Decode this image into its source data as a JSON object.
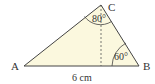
{
  "diagram": {
    "type": "triangle",
    "fill_color": "#fbf8de",
    "stroke_color": "#444444",
    "vertices": {
      "A": {
        "label": "A",
        "x": 24,
        "y": 66
      },
      "B": {
        "label": "B",
        "x": 139,
        "y": 66
      },
      "C": {
        "label": "C",
        "x": 101,
        "y": 5
      }
    },
    "angles": {
      "C": "80°",
      "B": "60°"
    },
    "side_AB_label": "6 cm",
    "altitude": {
      "from": "C",
      "foot_x": 101,
      "foot_y": 66,
      "style": "dashed"
    }
  }
}
